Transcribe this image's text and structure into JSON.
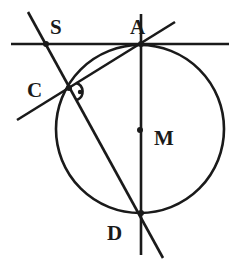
{
  "diagram": {
    "type": "geometry-figure",
    "colors": {
      "ink": "#1a1a1a",
      "background": "#ffffff"
    },
    "circle": {
      "center_label": "M",
      "cx": 140,
      "cy": 129,
      "r": 84
    },
    "points": [
      {
        "id": "S",
        "label": "S",
        "x": 46,
        "y": 44,
        "lx": 50,
        "ly": 34
      },
      {
        "id": "A",
        "label": "A",
        "x": 141,
        "y": 44,
        "lx": 130,
        "ly": 34
      },
      {
        "id": "C",
        "label": "C",
        "x": 69,
        "y": 88,
        "lx": 27,
        "ly": 97
      },
      {
        "id": "M",
        "label": "M",
        "x": 140,
        "y": 130,
        "lx": 154,
        "ly": 145
      },
      {
        "id": "D",
        "label": "D",
        "x": 141,
        "y": 213,
        "lx": 107,
        "ly": 240
      }
    ],
    "lines": [
      {
        "name": "tangent-at-A",
        "x1": 11,
        "y1": 44,
        "x2": 229,
        "y2": 44
      },
      {
        "name": "line-CA",
        "x1": 17,
        "y1": 120,
        "x2": 175,
        "y2": 22
      },
      {
        "name": "line-SD",
        "x1": 28,
        "y1": 12,
        "x2": 163,
        "y2": 258
      },
      {
        "name": "diameter-AD",
        "x1": 141,
        "y1": 14,
        "x2": 141,
        "y2": 255
      }
    ],
    "right_angle_marker": {
      "at": "C",
      "cx": 79,
      "cy": 92
    }
  }
}
